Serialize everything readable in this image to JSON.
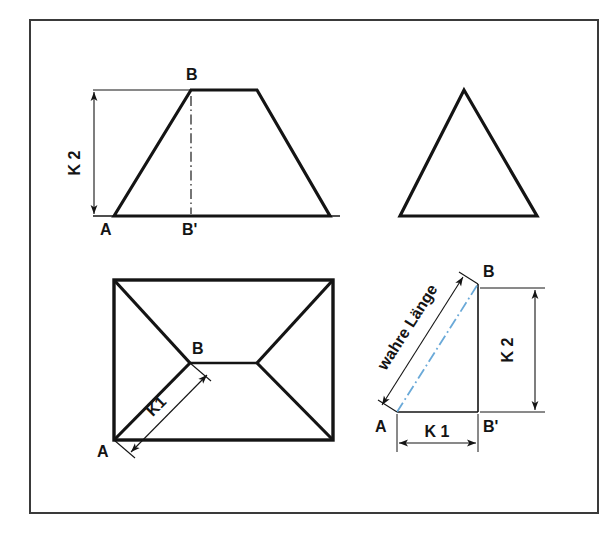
{
  "sheet": {
    "background_color": "#ffffff",
    "frame": {
      "name": "drawing-border-frame",
      "x": 30,
      "y": 20,
      "width": 568,
      "height": 493,
      "stroke_color": "#3a3a3a",
      "stroke_width": 2
    },
    "line_color": "#141414",
    "centerline_color_blue": "#6aa9d8",
    "centerline_color_black": "#1a1a1a",
    "dimension_color": "#141414"
  },
  "views": {
    "front_elevation": {
      "name": "front-elevation-trapezoid",
      "title_hidden": true,
      "shape": "trapezoid",
      "points": "114,216 191,90 257,90 330,216",
      "labels": {
        "apex": "B",
        "base_left": "A",
        "base_center": "B'"
      },
      "dimension": {
        "label": "K 2",
        "orientation": "vertical",
        "x": 93,
        "y_top": 90,
        "y_bottom": 216
      },
      "centerline": {
        "x": 191,
        "y_top": 90,
        "y_bottom": 216,
        "style": "dash-dot",
        "color": "#1a1a1a"
      }
    },
    "side_elevation": {
      "name": "side-elevation-triangle",
      "shape": "triangle",
      "points": "400,216 464,90 537,216"
    },
    "plan_view": {
      "name": "plan-view-hip-roof",
      "shape": "rectangle-with-hip-lines",
      "rect": {
        "x": 114,
        "y": 280,
        "width": 219,
        "height": 160
      },
      "ridge": {
        "x1": 190,
        "y1": 363,
        "x2": 257,
        "y2": 363
      },
      "hip_lines": [
        "114,280 190,363",
        "333,280 257,363",
        "114,440 190,363",
        "333,440 257,363"
      ],
      "labels": {
        "hip_point": "B",
        "corner": "A"
      },
      "dimension": {
        "label": "K 1",
        "orientation": "diagonal",
        "from": "A",
        "to": "B"
      }
    },
    "true_length_construction": {
      "name": "true-length-right-triangle",
      "shape": "right-triangle",
      "vertices": {
        "A": {
          "x": 397,
          "y": 412
        },
        "B": {
          "x": 478,
          "y": 284
        },
        "B_prime": {
          "x": 478,
          "y": 412
        }
      },
      "labels": {
        "A": "A",
        "B": "B",
        "B_prime": "B'"
      },
      "hypotenuse_centerline": {
        "style": "dash-dot",
        "color": "#6aa9d8"
      },
      "dimensions": [
        {
          "label": "wahre Länge",
          "orientation": "diagonal",
          "along": "hypotenuse A-B"
        },
        {
          "label": "K 2",
          "orientation": "vertical",
          "x": 535,
          "y_top": 288,
          "y_bottom": 412
        },
        {
          "label": "K 1",
          "orientation": "horizontal",
          "y": 443,
          "x_left": 397,
          "x_right": 478
        }
      ]
    }
  },
  "text_items": {
    "k1": "K 1",
    "k1_plan": "K1",
    "k2": "K 2",
    "point_a": "A",
    "point_b": "B",
    "point_b_prime": "B'",
    "wahre_laenge": "wahre Länge"
  }
}
